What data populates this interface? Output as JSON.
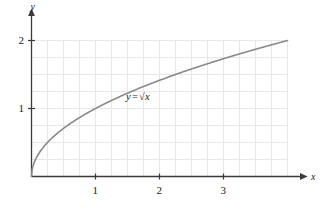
{
  "chart_data": {
    "type": "line",
    "title": "",
    "subtitle": "",
    "xlabel": "x",
    "ylabel": "y",
    "xlim": [
      0,
      4
    ],
    "ylim": [
      0,
      2
    ],
    "xticks": [
      1,
      2,
      3
    ],
    "yticks": [
      1,
      2
    ],
    "xtick_labels": [
      "1",
      "2",
      "3"
    ],
    "ytick_labels": [
      "1",
      "2"
    ],
    "grid": true,
    "grid_step_x": 0.25,
    "grid_step_y": 0.25,
    "legend": "none",
    "annotations": [
      {
        "text": "y = √x",
        "lhs": "y",
        "equals": "=",
        "radical_sign": "√",
        "radicand": "x",
        "x_data": 1.55,
        "y_data": 1.25
      }
    ],
    "series": [
      {
        "name": "y = √x",
        "color": "#8a8a8a",
        "x": [
          0,
          0.05,
          0.1,
          0.15,
          0.2,
          0.25,
          0.3,
          0.4,
          0.5,
          0.6,
          0.75,
          0.9,
          1.0,
          1.25,
          1.5,
          1.75,
          2.0,
          2.25,
          2.5,
          2.75,
          3.0,
          3.25,
          3.5,
          3.75,
          4.0
        ],
        "y": [
          0,
          0.224,
          0.316,
          0.387,
          0.447,
          0.5,
          0.548,
          0.632,
          0.707,
          0.775,
          0.866,
          0.949,
          1.0,
          1.118,
          1.225,
          1.323,
          1.414,
          1.5,
          1.581,
          1.658,
          1.732,
          1.803,
          1.871,
          1.936,
          2.0
        ]
      }
    ]
  },
  "axes": {
    "y_axis_name": "y",
    "x_axis_name": "x",
    "arrow_x": "arrowhead-right",
    "arrow_y": "arrowhead-up"
  },
  "colors": {
    "curve": "#8a8a8a",
    "axis": "#3a3a3a",
    "grid": "#e8e8ea",
    "text": "#1a1a1a",
    "background": "#ffffff"
  }
}
